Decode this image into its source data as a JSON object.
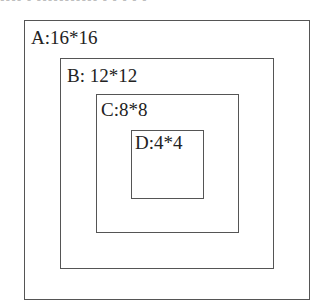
{
  "top_text": "▪▪▪▪ ▪ ▪▪▪▪▪▪▪▪▪▪▪ ▪ ▪ ▪ ▪ ▪",
  "boxes": [
    {
      "id": "A",
      "label": "A:16*16"
    },
    {
      "id": "B",
      "label": "B: 12*12"
    },
    {
      "id": "C",
      "label": "C:8*8"
    },
    {
      "id": "D",
      "label": "D:4*4"
    }
  ]
}
